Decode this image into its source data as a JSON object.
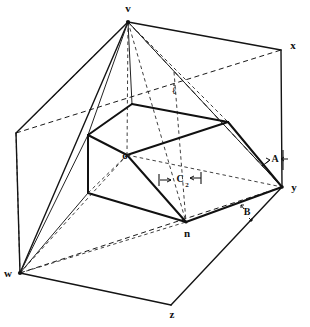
{
  "figure": {
    "background_color": "#ffffff",
    "ink_color": "#111111",
    "width": 310,
    "height": 327,
    "vertex_labels": [
      {
        "id": "v",
        "text": "v",
        "x": 128,
        "y": 9,
        "role": "apex"
      },
      {
        "id": "x",
        "text": "x",
        "x": 293,
        "y": 46,
        "role": "base-corner"
      },
      {
        "id": "y",
        "text": "y",
        "x": 294,
        "y": 188,
        "role": "base-corner"
      },
      {
        "id": "z",
        "text": "z",
        "x": 172,
        "y": 315,
        "role": "base-corner"
      },
      {
        "id": "w",
        "text": "w",
        "x": 8,
        "y": 274,
        "role": "base-corner"
      },
      {
        "id": "o",
        "text": "o",
        "x": 125,
        "y": 156,
        "role": "prism-vertex"
      },
      {
        "id": "n",
        "text": "n",
        "x": 187,
        "y": 234,
        "role": "prism-vertex"
      }
    ],
    "dimension_labels": [
      {
        "id": "A",
        "text": "A",
        "x": 275,
        "y": 160,
        "sub": "",
        "arrows": "both"
      },
      {
        "id": "B",
        "text": "B",
        "x": 247,
        "y": 213,
        "sub": "",
        "arrows": "both"
      },
      {
        "id": "C2",
        "text": "C",
        "x": 180,
        "y": 180,
        "sub": "2",
        "arrows": "both"
      },
      {
        "id": "Q",
        "text": "ℓ",
        "x": 174,
        "y": 92,
        "sub": "",
        "arrows": "none"
      }
    ],
    "line_styles": {
      "solid_heavy": "visible prism edges",
      "solid": "visible pyramid edges",
      "dashed": "hidden construction lines"
    }
  }
}
